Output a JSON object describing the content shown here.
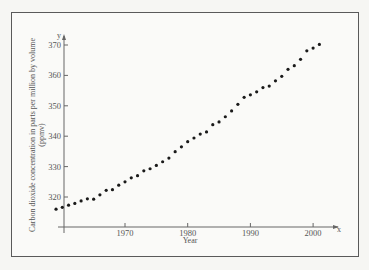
{
  "chart_data": {
    "type": "scatter",
    "title": "",
    "xlabel": "Year",
    "ylabel": "Carbon dioxide concentration in parts per million by volume (ppmv)",
    "ylabel_lines": [
      "Carbon dioxide concentration in parts per million by volume",
      "(ppmv)"
    ],
    "x_axis_letter": "x",
    "y_axis_letter": "y",
    "xlim": [
      1960,
      2004
    ],
    "ylim": [
      310,
      372
    ],
    "x_ticks": [
      1970,
      1980,
      1990,
      2000
    ],
    "y_ticks": [
      320,
      330,
      340,
      350,
      360,
      370
    ],
    "grid": false,
    "legend": null,
    "series": [
      {
        "name": "CO2 concentration",
        "x": [
          1959,
          1960,
          1961,
          1962,
          1963,
          1964,
          1965,
          1966,
          1967,
          1968,
          1969,
          1970,
          1971,
          1972,
          1973,
          1974,
          1975,
          1976,
          1977,
          1978,
          1979,
          1980,
          1981,
          1982,
          1983,
          1984,
          1985,
          1986,
          1987,
          1988,
          1989,
          1990,
          1991,
          1992,
          1993,
          1994,
          1995,
          1996,
          1997,
          1998,
          1999,
          2000,
          2001
        ],
        "values": [
          316.0,
          316.6,
          317.3,
          317.9,
          318.7,
          319.4,
          319.3,
          320.7,
          322.2,
          322.4,
          323.9,
          325.0,
          326.3,
          327.0,
          328.6,
          329.3,
          330.4,
          331.6,
          332.8,
          334.9,
          336.5,
          338.2,
          339.4,
          340.7,
          341.4,
          343.8,
          344.7,
          346.4,
          348.3,
          350.5,
          352.8,
          353.6,
          354.6,
          356.0,
          356.5,
          358.2,
          359.7,
          362.0,
          363.2,
          365.3,
          368.1,
          369.0,
          370.2
        ]
      }
    ]
  },
  "colors": {
    "background": "#f6f6f3",
    "frame": "#5a5a5a",
    "axis": "#666666",
    "points": "#1a1a1a"
  }
}
